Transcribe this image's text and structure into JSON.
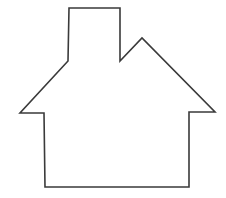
{
  "diagram": {
    "parts": [
      "chimney",
      "roof",
      "eaves",
      "walls",
      "base"
    ],
    "colors": {
      "background": "#ffffff",
      "stroke": "#3a3a3a"
    }
  }
}
